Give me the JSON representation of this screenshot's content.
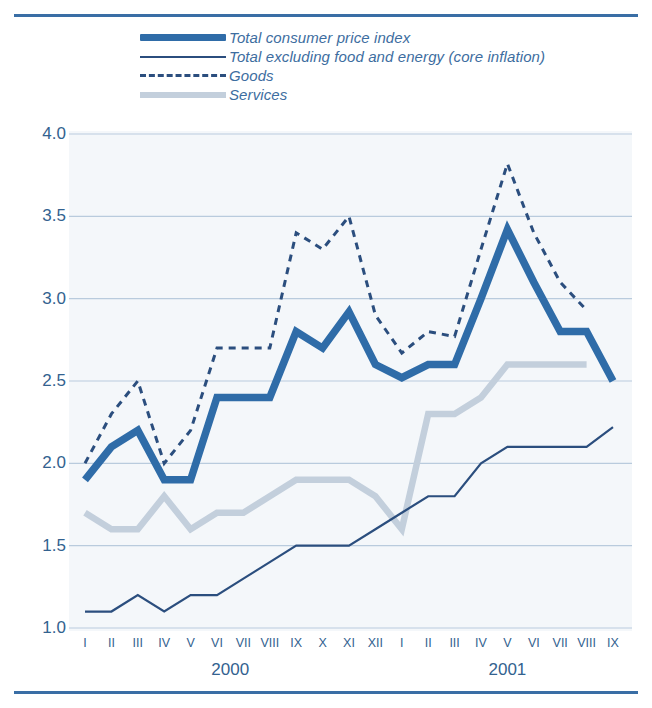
{
  "legend": {
    "items": [
      {
        "label": "Total consumer price index",
        "style": "thick",
        "color": "#2f6ca8"
      },
      {
        "label": "Total excluding food and energy (core inflation)",
        "style": "thin",
        "color": "#2b4e7e"
      },
      {
        "label": "Goods",
        "style": "dashed",
        "color": "#2b4e7e"
      },
      {
        "label": "Services",
        "style": "light",
        "color": "#c3cfdc"
      }
    ]
  },
  "axes": {
    "y_ticks": [
      "4.0",
      "3.5",
      "3.0",
      "2.5",
      "2.0",
      "1.5",
      "1.0"
    ],
    "x_ticks": [
      "I",
      "II",
      "III",
      "IV",
      "V",
      "VI",
      "VII",
      "VIII",
      "IX",
      "X",
      "XI",
      "XII",
      "I",
      "II",
      "III",
      "IV",
      "V",
      "VI",
      "VII",
      "VIII",
      "IX"
    ],
    "year_labels": [
      {
        "text": "2000",
        "index": 5.5
      },
      {
        "text": "2001",
        "index": 16.0
      }
    ]
  },
  "colors": {
    "cpi": "#2f6ca8",
    "core": "#2b4e7e",
    "goods": "#2b4e7e",
    "services": "#c3cfdc",
    "grid": "#b9cbdd",
    "plot_bg": "#f4f7fa",
    "rule": "#3a6ea5",
    "text": "#33628f"
  },
  "chart_data": {
    "type": "line",
    "title": "",
    "xlabel": "",
    "ylabel": "",
    "ylim": [
      1.0,
      4.0
    ],
    "grid": true,
    "legend_position": "top",
    "categories": [
      "I",
      "II",
      "III",
      "IV",
      "V",
      "VI",
      "VII",
      "VIII",
      "IX",
      "X",
      "XI",
      "XII",
      "I",
      "II",
      "III",
      "IV",
      "V",
      "VI",
      "VII",
      "VIII",
      "IX"
    ],
    "year_groups": [
      "2000",
      "2000",
      "2000",
      "2000",
      "2000",
      "2000",
      "2000",
      "2000",
      "2000",
      "2000",
      "2000",
      "2000",
      "2001",
      "2001",
      "2001",
      "2001",
      "2001",
      "2001",
      "2001",
      "2001",
      "2001"
    ],
    "series": [
      {
        "name": "Total consumer price index",
        "style": "thick",
        "color": "#2f6ca8",
        "values": [
          1.9,
          2.1,
          2.2,
          1.9,
          1.9,
          2.4,
          2.4,
          2.4,
          2.8,
          2.7,
          2.92,
          2.6,
          2.52,
          2.6,
          2.6,
          3.0,
          3.42,
          3.1,
          2.8,
          2.8,
          2.5
        ]
      },
      {
        "name": "Total excluding food and energy (core inflation)",
        "style": "thin",
        "color": "#2b4e7e",
        "values": [
          1.1,
          1.1,
          1.2,
          1.1,
          1.2,
          1.2,
          1.3,
          1.4,
          1.5,
          1.5,
          1.5,
          1.6,
          1.7,
          1.8,
          1.8,
          2.0,
          2.1,
          2.1,
          2.1,
          2.1,
          2.22
        ]
      },
      {
        "name": "Goods",
        "style": "dashed",
        "color": "#2b4e7e",
        "values": [
          2.0,
          2.3,
          2.5,
          2.0,
          2.2,
          2.7,
          2.7,
          2.7,
          3.4,
          3.3,
          3.5,
          2.9,
          2.67,
          2.8,
          2.77,
          3.3,
          3.82,
          3.4,
          3.1,
          2.93,
          null
        ]
      },
      {
        "name": "Services",
        "style": "light",
        "color": "#c3cfdc",
        "values": [
          1.7,
          1.6,
          1.6,
          1.8,
          1.6,
          1.7,
          1.7,
          1.8,
          1.9,
          1.9,
          1.9,
          1.8,
          1.6,
          2.3,
          2.3,
          2.4,
          2.6,
          2.6,
          2.6,
          2.6,
          null
        ]
      }
    ]
  }
}
